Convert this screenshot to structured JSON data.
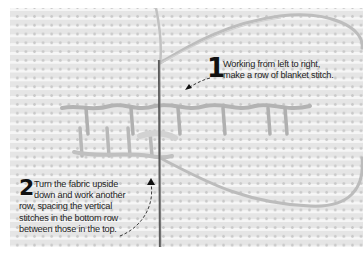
{
  "figure": {
    "colors": {
      "fabric": "#ececec",
      "thread": "#b8b8b8",
      "needle": "#5a5a5a",
      "text": "#222222",
      "border": "#ffffff"
    }
  },
  "steps": [
    {
      "number": "1",
      "lines": [
        "Working from left to right,",
        "make a row of blanket stitch."
      ]
    },
    {
      "number": "2",
      "lines": [
        "Turn the fabric upside",
        "down and work another",
        "row, spacing the vertical",
        "stitches in the bottom row",
        "between those in the top."
      ]
    }
  ]
}
